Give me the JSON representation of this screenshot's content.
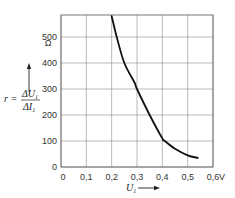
{
  "chart_data": {
    "type": "line",
    "title": "",
    "xlabel": "U1",
    "xunit": "V",
    "ylabel": "r = ΔU1 / ΔI1",
    "yunit": "Ω",
    "xlim": [
      0,
      0.6
    ],
    "ylim": [
      0,
      580
    ],
    "xticks": [
      0,
      0.1,
      0.2,
      0.3,
      0.4,
      0.5,
      0.6
    ],
    "xtick_labels": [
      "0",
      "0,1",
      "0,2",
      "0,3",
      "0,4",
      "0,5",
      "0,6"
    ],
    "yticks": [
      0,
      100,
      200,
      300,
      400,
      500
    ],
    "ytick_labels": [
      "0",
      "100",
      "200",
      "300",
      "400",
      "500"
    ],
    "grid": true,
    "series": [
      {
        "name": "r",
        "x": [
          0.2,
          0.22,
          0.25,
          0.29,
          0.3,
          0.35,
          0.4,
          0.41,
          0.45,
          0.5,
          0.54
        ],
        "y": [
          580,
          500,
          400,
          325,
          300,
          200,
          110,
          100,
          70,
          45,
          35
        ]
      }
    ]
  },
  "labels": {
    "y_unit": "Ω",
    "x_unit": "V",
    "y_label_lhs": "r =",
    "y_label_num": "ΔU",
    "y_label_num_sub": "1",
    "y_label_den": "ΔI",
    "y_label_den_sub": "1",
    "x_label": "U",
    "x_label_sub": "1"
  }
}
